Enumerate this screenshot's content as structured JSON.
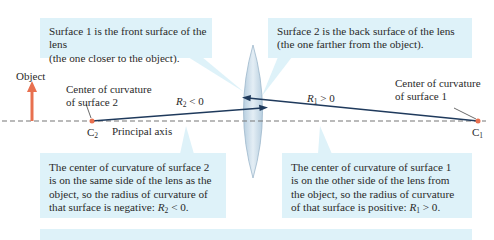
{
  "callouts": {
    "surface1_note": "Surface 1 is the front surface of the lens (the one closer to the object).",
    "surface1_line1": "Surface 1 is the front surface of the lens",
    "surface1_line2": "(the one closer to the object).",
    "surface2_line1": "Surface 2 is the back surface of the lens",
    "surface2_line2": "(the one farther from the object).",
    "c2_note_lines": [
      "The center of curvature of surface 2",
      "is on the same side of the lens as the",
      "object, so the radius of curvature of",
      "that surface is negative: "
    ],
    "c2_condition": {
      "symbol": "R",
      "sub": "2",
      "rel": " < 0."
    },
    "c1_note_lines": [
      "The center of curvature of surface 1",
      "is on the other side of the lens from",
      "the object, so the radius of curvature",
      "of that surface is positive: "
    ],
    "c1_condition": {
      "symbol": "R",
      "sub": "1",
      "rel": " > 0."
    }
  },
  "labels": {
    "object": "Object",
    "c2_title_line1": "Center of curvature",
    "c2_title_line2": "of surface 2",
    "c1_title_line1": "Center of curvature",
    "c1_title_line2": "of surface 1",
    "principal_axis": "Principal axis",
    "c2_point": {
      "symbol": "C",
      "sub": "2"
    },
    "c1_point": {
      "symbol": "C",
      "sub": "1"
    },
    "r2_label": {
      "symbol": "R",
      "sub": "2",
      "rel": " < 0"
    },
    "r1_label": {
      "symbol": "R",
      "sub": "1",
      "rel": " > 0"
    }
  },
  "colors": {
    "callout_bg": "#def2f9",
    "object_arrow": "#e8704f",
    "radius_line": "#1f3a5c",
    "axis": "#777777",
    "lens_fill": "#c9dbe8",
    "point": "#e8704f"
  }
}
